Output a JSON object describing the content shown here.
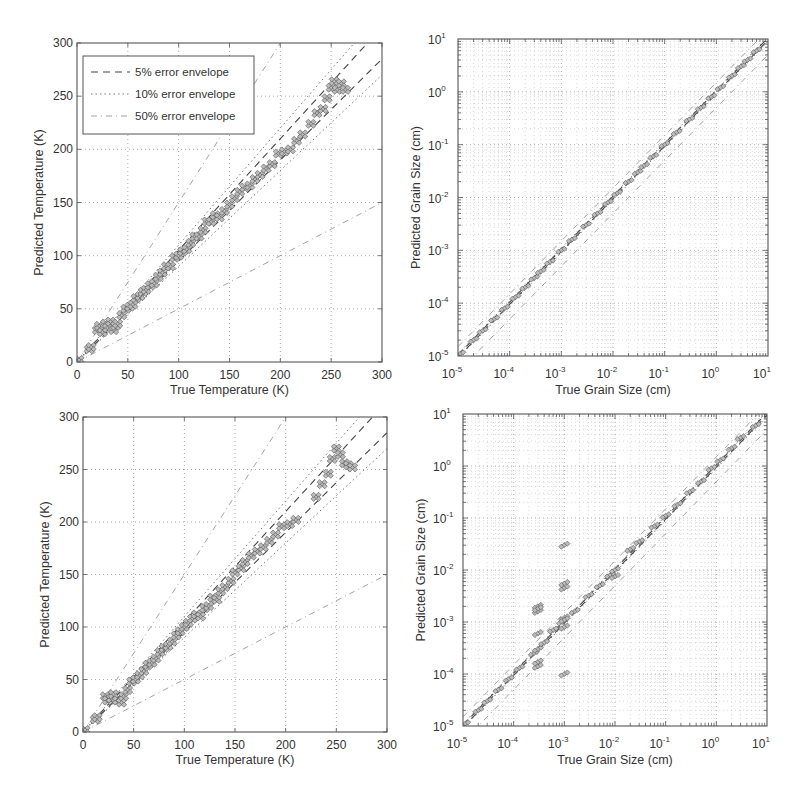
{
  "chart_data": [
    {
      "id": "temp-top",
      "type": "scatter",
      "xlabel": "True Temperature (K)",
      "ylabel": "Predicted Temperature (K)",
      "xlim": [
        0,
        300
      ],
      "ylim": [
        0,
        300
      ],
      "xscale": "linear",
      "yscale": "linear",
      "xticks": [
        "0",
        "50",
        "100",
        "150",
        "200",
        "250",
        "300"
      ],
      "yticks": [
        "0",
        "50",
        "100",
        "150",
        "200",
        "250",
        "300"
      ],
      "xtick_values": [
        0,
        50,
        100,
        150,
        200,
        250,
        300
      ],
      "ytick_values": [
        0,
        50,
        100,
        150,
        200,
        250,
        300
      ],
      "grid": true,
      "legend": {
        "placement": "top-left",
        "entries": [
          {
            "label": "5% error envelope",
            "style": "dashed"
          },
          {
            "label": "10% error envelope",
            "style": "dotted"
          },
          {
            "label": "50% error envelope",
            "style": "dash-dot"
          }
        ]
      },
      "envelopes": [
        0.05,
        0.1,
        0.5
      ],
      "series": [
        {
          "name": "predictions",
          "marker": "diamond",
          "x": [
            2,
            12,
            14,
            20,
            22,
            25,
            28,
            30,
            33,
            36,
            38,
            40,
            44,
            48,
            52,
            55,
            58,
            62,
            65,
            68,
            72,
            76,
            80,
            84,
            88,
            92,
            96,
            100,
            104,
            108,
            112,
            116,
            120,
            124,
            128,
            132,
            136,
            140,
            145,
            150,
            155,
            160,
            165,
            170,
            175,
            180,
            186,
            192,
            198,
            204,
            210,
            216,
            222,
            230,
            236,
            242,
            246,
            250,
            253,
            256,
            260,
            264
          ],
          "y": [
            2,
            12,
            14,
            30,
            34,
            28,
            36,
            32,
            38,
            30,
            34,
            36,
            44,
            50,
            52,
            54,
            60,
            62,
            66,
            68,
            72,
            74,
            80,
            84,
            90,
            90,
            98,
            100,
            104,
            106,
            112,
            118,
            118,
            124,
            132,
            132,
            138,
            136,
            142,
            148,
            154,
            160,
            164,
            166,
            172,
            176,
            182,
            186,
            196,
            198,
            200,
            208,
            214,
            224,
            234,
            238,
            248,
            258,
            264,
            256,
            262,
            256
          ]
        }
      ]
    },
    {
      "id": "grain-top",
      "type": "scatter",
      "xlabel": "True Grain Size (cm)",
      "ylabel": "Predicted Grain Size (cm)",
      "xlim": [
        1e-05,
        10
      ],
      "ylim": [
        1e-05,
        10
      ],
      "xscale": "log",
      "yscale": "log",
      "xticks": [
        {
          "base": "10",
          "exp": "-5"
        },
        {
          "base": "10",
          "exp": "-4"
        },
        {
          "base": "10",
          "exp": "-3"
        },
        {
          "base": "10",
          "exp": "-2"
        },
        {
          "base": "10",
          "exp": "-1"
        },
        {
          "base": "10",
          "exp": "0"
        },
        {
          "base": "10",
          "exp": "1"
        }
      ],
      "yticks": [
        {
          "base": "10",
          "exp": "-5"
        },
        {
          "base": "10",
          "exp": "-4"
        },
        {
          "base": "10",
          "exp": "-3"
        },
        {
          "base": "10",
          "exp": "-2"
        },
        {
          "base": "10",
          "exp": "-1"
        },
        {
          "base": "10",
          "exp": "0"
        },
        {
          "base": "10",
          "exp": "1"
        }
      ],
      "grid": true,
      "envelopes": [
        0.05,
        0.1,
        0.5
      ],
      "series": [
        {
          "name": "predictions",
          "marker": "diamond",
          "x": [
            1.1e-05,
            2e-05,
            3e-05,
            5e-05,
            8e-05,
            0.00013,
            0.0002,
            0.0003,
            0.0004,
            0.0006,
            0.001,
            0.0016,
            0.003,
            0.005,
            0.008,
            0.012,
            0.02,
            0.03,
            0.04,
            0.06,
            0.1,
            0.17,
            0.3,
            0.5,
            0.8,
            1.2,
            2,
            3,
            4,
            6
          ],
          "y": [
            1.1e-05,
            2e-05,
            3e-05,
            5e-05,
            8e-05,
            0.00013,
            0.0002,
            0.0003,
            0.0004,
            0.0006,
            0.001,
            0.0016,
            0.003,
            0.005,
            0.008,
            0.012,
            0.02,
            0.03,
            0.04,
            0.06,
            0.1,
            0.17,
            0.3,
            0.5,
            0.8,
            1.2,
            2,
            3,
            4,
            6
          ]
        }
      ]
    },
    {
      "id": "temp-bottom",
      "type": "scatter",
      "xlabel": "True Temperature (K)",
      "ylabel": "Predicted Temperature (K)",
      "xlim": [
        0,
        300
      ],
      "ylim": [
        0,
        300
      ],
      "xscale": "linear",
      "yscale": "linear",
      "xticks": [
        "0",
        "50",
        "100",
        "150",
        "200",
        "250",
        "300"
      ],
      "yticks": [
        "0",
        "50",
        "100",
        "150",
        "200",
        "250",
        "300"
      ],
      "xtick_values": [
        0,
        50,
        100,
        150,
        200,
        250,
        300
      ],
      "ytick_values": [
        0,
        50,
        100,
        150,
        200,
        250,
        300
      ],
      "grid": true,
      "envelopes": [
        0.05,
        0.1,
        0.5
      ],
      "series": [
        {
          "name": "predictions",
          "marker": "diamond",
          "x": [
            2,
            12,
            14,
            22,
            24,
            28,
            30,
            34,
            38,
            40,
            44,
            48,
            52,
            56,
            60,
            64,
            68,
            72,
            76,
            80,
            84,
            88,
            92,
            96,
            100,
            104,
            108,
            112,
            116,
            120,
            124,
            128,
            132,
            136,
            140,
            146,
            150,
            156,
            160,
            166,
            172,
            178,
            184,
            190,
            196,
            204,
            210,
            230,
            236,
            242,
            246,
            250,
            254,
            258,
            262,
            266
          ],
          "y": [
            2,
            12,
            14,
            34,
            30,
            32,
            36,
            30,
            28,
            34,
            40,
            48,
            50,
            54,
            58,
            64,
            66,
            70,
            76,
            80,
            82,
            86,
            92,
            96,
            100,
            104,
            108,
            112,
            110,
            118,
            120,
            128,
            126,
            134,
            138,
            144,
            152,
            156,
            162,
            168,
            172,
            176,
            182,
            188,
            196,
            198,
            202,
            224,
            236,
            246,
            260,
            270,
            264,
            256,
            254,
            252
          ]
        }
      ]
    },
    {
      "id": "grain-bottom",
      "type": "scatter",
      "xlabel": "True Grain Size (cm)",
      "ylabel": "Predicted Grain Size (cm)",
      "xlim": [
        1e-05,
        10
      ],
      "ylim": [
        1e-05,
        10
      ],
      "xscale": "log",
      "yscale": "log",
      "xticks": [
        {
          "base": "10",
          "exp": "-5"
        },
        {
          "base": "10",
          "exp": "-4"
        },
        {
          "base": "10",
          "exp": "-3"
        },
        {
          "base": "10",
          "exp": "-2"
        },
        {
          "base": "10",
          "exp": "-1"
        },
        {
          "base": "10",
          "exp": "0"
        },
        {
          "base": "10",
          "exp": "1"
        }
      ],
      "yticks": [
        {
          "base": "10",
          "exp": "-5"
        },
        {
          "base": "10",
          "exp": "-4"
        },
        {
          "base": "10",
          "exp": "-3"
        },
        {
          "base": "10",
          "exp": "-2"
        },
        {
          "base": "10",
          "exp": "-1"
        },
        {
          "base": "10",
          "exp": "0"
        },
        {
          "base": "10",
          "exp": "1"
        }
      ],
      "grid": true,
      "envelopes": [
        0.05,
        0.1,
        0.5
      ],
      "series": [
        {
          "name": "predictions",
          "marker": "diamond",
          "x": [
            1.1e-05,
            2e-05,
            3e-05,
            5e-05,
            8e-05,
            0.00013,
            0.00025,
            0.0003,
            0.0003,
            0.0003,
            0.0003,
            0.0003,
            0.0003,
            0.0003,
            0.0004,
            0.0006,
            0.0009,
            0.001,
            0.001,
            0.001,
            0.001,
            0.001,
            0.001,
            0.001,
            0.0016,
            0.003,
            0.005,
            0.008,
            0.01,
            0.01,
            0.02,
            0.03,
            0.06,
            0.1,
            0.17,
            0.3,
            0.5,
            0.8,
            1.2,
            2,
            3,
            6
          ],
          "y": [
            1.1e-05,
            2e-05,
            3e-05,
            5e-05,
            8e-05,
            0.00013,
            0.00025,
            0.00014,
            0.00017,
            0.0003,
            0.0006,
            0.0016,
            0.002,
            0.0018,
            0.0004,
            0.0007,
            0.001,
            0.0001,
            0.0008,
            0.0012,
            0.0045,
            0.0055,
            0.03,
            0.0011,
            0.0016,
            0.0032,
            0.005,
            0.008,
            0.0075,
            0.01,
            0.025,
            0.035,
            0.07,
            0.11,
            0.18,
            0.32,
            0.5,
            0.9,
            1.3,
            2.2,
            3.5,
            6
          ]
        }
      ]
    }
  ]
}
